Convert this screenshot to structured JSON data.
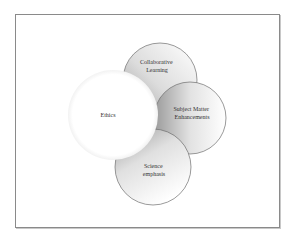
{
  "diagram": {
    "type": "overlapping-circles",
    "center": {
      "label": "Ethics"
    },
    "satellites": [
      {
        "label_lines": [
          "Collaborative",
          "Learning"
        ]
      },
      {
        "label_lines": [
          "Subject Matter",
          "Enhancements"
        ]
      },
      {
        "label_lines": [
          "Science",
          "emphasis"
        ]
      }
    ],
    "colors": {
      "frame_border": "#8a8a8a",
      "circle_outline": "#6f6f6f",
      "shade_dark": "#9a9a9a",
      "shade_light": "#ffffff",
      "text": "#333333"
    }
  }
}
